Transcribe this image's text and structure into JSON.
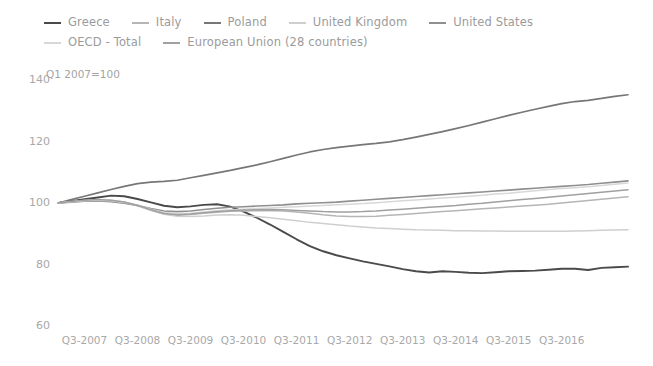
{
  "chart_data": {
    "type": "line",
    "title": "",
    "subtitle": "",
    "annotation": "Q1 2007=100",
    "xlabel": "",
    "ylabel": "",
    "ylim": [
      60,
      140
    ],
    "yticks": [
      140,
      120,
      100,
      80,
      60
    ],
    "xticks": [
      "Q3-2007",
      "Q3-2008",
      "Q3-2009",
      "Q3-2010",
      "Q3-2011",
      "Q3-2012",
      "Q3-2013",
      "Q3-2014",
      "Q3-2015",
      "Q3-2016"
    ],
    "grid": false,
    "legend_position": "top",
    "x_note": "Quarterly series; x positions are quarters from Q1-2007 to Q4-2016",
    "series": [
      {
        "name": "Greece",
        "color": "#4a4a4a",
        "width": 1.9,
        "values": [
          100.0,
          100.6,
          101.2,
          101.8,
          102.4,
          102.2,
          101.3,
          100.2,
          99.1,
          98.6,
          98.9,
          99.4,
          99.6,
          98.8,
          97.2,
          95.2,
          93.0,
          90.6,
          88.2,
          86.0,
          84.3,
          83.0,
          82.0,
          81.0,
          80.2,
          79.4,
          78.5,
          77.8,
          77.4,
          77.8,
          77.6,
          77.3,
          77.2,
          77.5,
          77.8,
          77.9,
          78.0,
          78.3,
          78.6,
          78.6,
          78.2,
          78.9,
          79.1,
          79.3
        ]
      },
      {
        "name": "Italy",
        "color": "#b5b5b5",
        "width": 1.5,
        "values": [
          100.0,
          100.4,
          100.7,
          100.8,
          100.6,
          100.1,
          99.1,
          97.6,
          96.4,
          96.0,
          96.3,
          96.7,
          97.0,
          97.3,
          97.4,
          97.5,
          97.6,
          97.4,
          97.1,
          96.7,
          96.2,
          95.8,
          95.6,
          95.6,
          95.7,
          96.0,
          96.3,
          96.6,
          96.9,
          97.2,
          97.5,
          97.8,
          98.1,
          98.4,
          98.7,
          99.0,
          99.3,
          99.6,
          100.0,
          100.4,
          100.8,
          101.2,
          101.6,
          102.0
        ]
      },
      {
        "name": "Poland",
        "color": "#777777",
        "width": 1.7,
        "values": [
          100.0,
          101.1,
          102.2,
          103.3,
          104.4,
          105.4,
          106.3,
          106.8,
          107.0,
          107.4,
          108.2,
          109.0,
          109.8,
          110.6,
          111.5,
          112.4,
          113.4,
          114.5,
          115.6,
          116.6,
          117.4,
          118.0,
          118.5,
          119.0,
          119.4,
          119.9,
          120.6,
          121.4,
          122.3,
          123.2,
          124.2,
          125.2,
          126.3,
          127.4,
          128.5,
          129.5,
          130.5,
          131.4,
          132.3,
          133.0,
          133.4,
          134.0,
          134.7,
          135.2
        ]
      },
      {
        "name": "United Kingdom",
        "color": "#cfcfcf",
        "width": 1.5,
        "values": [
          100.0,
          100.4,
          100.8,
          101.0,
          100.9,
          100.3,
          99.2,
          97.6,
          96.3,
          95.7,
          95.6,
          95.8,
          96.1,
          96.2,
          96.0,
          95.6,
          95.2,
          94.7,
          94.2,
          93.7,
          93.3,
          92.9,
          92.5,
          92.2,
          91.9,
          91.7,
          91.5,
          91.3,
          91.2,
          91.1,
          91.0,
          91.0,
          90.9,
          90.9,
          90.8,
          90.8,
          90.8,
          90.8,
          90.8,
          90.9,
          91.0,
          91.1,
          91.2,
          91.3
        ]
      },
      {
        "name": "United States",
        "color": "#8f8f8f",
        "width": 1.6,
        "values": [
          100.0,
          100.3,
          100.6,
          100.7,
          100.4,
          99.9,
          99.2,
          98.2,
          97.4,
          97.2,
          97.4,
          97.9,
          98.3,
          98.6,
          98.8,
          99.0,
          99.2,
          99.4,
          99.7,
          99.9,
          100.1,
          100.3,
          100.6,
          100.9,
          101.2,
          101.5,
          101.8,
          102.1,
          102.4,
          102.7,
          103.0,
          103.3,
          103.6,
          103.9,
          104.2,
          104.5,
          104.8,
          105.1,
          105.4,
          105.7,
          106.0,
          106.4,
          106.8,
          107.2
        ]
      },
      {
        "name": "OECD - Total",
        "color": "#d8d8d8",
        "width": 1.5,
        "values": [
          100.0,
          100.4,
          100.7,
          100.9,
          100.7,
          100.2,
          99.3,
          98.0,
          96.9,
          96.5,
          96.7,
          97.1,
          97.5,
          97.8,
          98.0,
          98.2,
          98.4,
          98.6,
          98.8,
          99.0,
          99.2,
          99.4,
          99.6,
          99.8,
          100.1,
          100.4,
          100.7,
          101.0,
          101.3,
          101.6,
          101.9,
          102.2,
          102.5,
          102.9,
          103.2,
          103.6,
          104.0,
          104.4,
          104.7,
          105.0,
          105.3,
          105.7,
          106.1,
          106.5
        ]
      },
      {
        "name": "European Union (28 countries)",
        "color": "#a0a0a0",
        "width": 1.5,
        "values": [
          100.0,
          100.5,
          100.9,
          101.1,
          100.9,
          100.3,
          99.3,
          97.8,
          96.6,
          96.2,
          96.4,
          96.8,
          97.2,
          97.5,
          97.7,
          97.8,
          97.9,
          97.8,
          97.6,
          97.4,
          97.2,
          97.1,
          97.1,
          97.2,
          97.4,
          97.7,
          98.0,
          98.3,
          98.6,
          98.9,
          99.2,
          99.6,
          99.9,
          100.3,
          100.7,
          101.1,
          101.5,
          101.9,
          102.3,
          102.7,
          103.1,
          103.5,
          103.9,
          104.3
        ]
      }
    ]
  },
  "legend": {
    "items": [
      {
        "label": "Greece"
      },
      {
        "label": "Italy"
      },
      {
        "label": "Poland"
      },
      {
        "label": "United Kingdom"
      },
      {
        "label": "United States"
      },
      {
        "label": "OECD - Total"
      },
      {
        "label": "European Union (28 countries)"
      }
    ]
  }
}
